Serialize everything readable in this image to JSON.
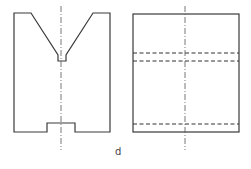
{
  "figure": {
    "label": "d",
    "views": [
      {
        "name": "front-view",
        "description": "V-block front view with V-groove, relief slot at apex and bottom notch",
        "outline_points": [
          [
            14,
            13
          ],
          [
            31,
            13
          ],
          [
            58,
            55
          ],
          [
            58,
            61
          ],
          [
            66,
            61
          ],
          [
            66,
            55
          ],
          [
            93,
            13
          ],
          [
            110,
            13
          ],
          [
            110,
            132
          ],
          [
            75,
            132
          ],
          [
            75,
            123
          ],
          [
            47,
            123
          ],
          [
            47,
            132
          ],
          [
            14,
            132
          ]
        ],
        "centerline": {
          "x": 61,
          "y1": 6,
          "y2": 150
        }
      },
      {
        "name": "side-view",
        "description": "Side view rectangle with hidden lines",
        "rect": {
          "x": 133,
          "y": 14,
          "width": 106,
          "height": 118
        },
        "hidden_lines_y": [
          53,
          61,
          124
        ],
        "centerline": {
          "x": 185,
          "y1": 6,
          "y2": 150
        }
      }
    ]
  },
  "colors": {
    "line": "#3a3a3a",
    "background": "#ffffff"
  }
}
